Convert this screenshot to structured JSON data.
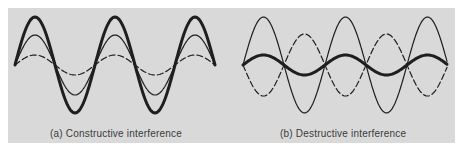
{
  "figure": {
    "background_color": "#d9d9d9",
    "line_color": "#1e1e1e",
    "panels": [
      {
        "id": "a",
        "caption": "(a)  Constructive interference",
        "x_start": 15,
        "x_end": 215,
        "midline_y": 65,
        "period": 80,
        "waves": [
          {
            "name": "wave-1-dashed",
            "style": "dashed",
            "amplitude": 10,
            "phase": 0,
            "stroke_width": 1.2
          },
          {
            "name": "wave-2-thin",
            "style": "solid",
            "amplitude": 30,
            "phase": 0,
            "stroke_width": 1.2
          },
          {
            "name": "resultant-thick",
            "style": "solid",
            "amplitude": 48,
            "phase": 0,
            "stroke_width": 3
          }
        ]
      },
      {
        "id": "b",
        "caption": "(b)  Destructive interference",
        "x_start": 243,
        "x_end": 447,
        "midline_y": 65,
        "period": 82,
        "waves": [
          {
            "name": "wave-1-thin",
            "style": "solid",
            "amplitude": 48,
            "phase": 0,
            "stroke_width": 1.2
          },
          {
            "name": "wave-2-dashed",
            "style": "dashed",
            "amplitude": 31,
            "phase": 180,
            "stroke_width": 1.2
          },
          {
            "name": "resultant-thick",
            "style": "solid",
            "amplitude": 10,
            "phase": 0,
            "stroke_width": 3
          }
        ]
      }
    ]
  }
}
